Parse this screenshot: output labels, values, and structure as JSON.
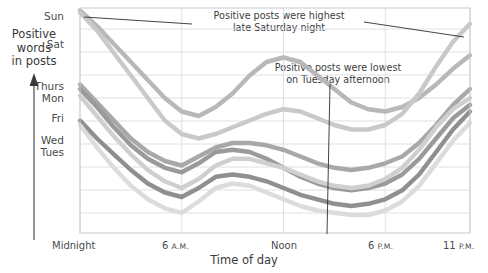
{
  "axis": {
    "y_title_lines": [
      "Positive",
      "words",
      "in posts"
    ],
    "x_title": "Time of day",
    "y_tick_labels": [
      "Sun",
      "Sat",
      "Thurs",
      "Mon",
      "Fri",
      "Wed",
      "Tues"
    ],
    "x_tick_labels": [
      "Midnight",
      "6 A.M.",
      "Noon",
      "6 P.M.",
      "11 P.M."
    ]
  },
  "annotations": [
    {
      "line1": "Positive posts were highest",
      "line2": "late Saturday night"
    },
    {
      "line1": "Positive posts were lowest",
      "line2": "on Tuesday afternoon"
    }
  ],
  "chart_data": {
    "type": "line",
    "title": "",
    "xlabel": "Time of day",
    "ylabel": "Positive words in posts",
    "grid": true,
    "legend": "none",
    "xlim": [
      0,
      23
    ],
    "ylim": [
      0,
      100
    ],
    "x": [
      0,
      1,
      2,
      3,
      4,
      5,
      6,
      7,
      8,
      9,
      10,
      11,
      12,
      13,
      14,
      15,
      16,
      17,
      18,
      19,
      20,
      21,
      22,
      23
    ],
    "x_ticks": [
      0,
      6,
      12,
      18,
      23
    ],
    "x_tick_labels": [
      "Midnight",
      "6 A.M.",
      "Noon",
      "6 P.M.",
      "11 P.M."
    ],
    "y_ticks": [
      96,
      84,
      72,
      60,
      48,
      36,
      24,
      12
    ],
    "y_tick_labels": [
      "Sun",
      "Sat",
      "Thurs",
      "Mon",
      "Fri",
      "Wed",
      "Tues"
    ],
    "series": [
      {
        "name": "Sun",
        "color": "#b8b8b8",
        "values": [
          99,
          92,
          84,
          76,
          68,
          60,
          54,
          52,
          56,
          62,
          70,
          76,
          78,
          76,
          70,
          64,
          58,
          55,
          54,
          56,
          60,
          66,
          73,
          79
        ]
      },
      {
        "name": "Sat",
        "color": "#c9c9c9",
        "values": [
          98,
          90,
          80,
          70,
          60,
          50,
          44,
          42,
          44,
          47,
          50,
          53,
          55,
          54,
          51,
          48,
          46,
          46,
          48,
          53,
          62,
          74,
          85,
          93
        ]
      },
      {
        "name": "Thurs",
        "color": "#a8a8a8",
        "values": [
          66,
          58,
          50,
          42,
          36,
          32,
          30,
          34,
          38,
          40,
          40,
          39,
          37,
          34,
          31,
          29,
          28,
          29,
          31,
          34,
          40,
          48,
          57,
          64
        ]
      },
      {
        "name": "Mon",
        "color": "#9a9a9a",
        "values": [
          64,
          56,
          47,
          39,
          33,
          29,
          27,
          31,
          36,
          37,
          36,
          33,
          29,
          25,
          22,
          20,
          19,
          20,
          22,
          26,
          33,
          42,
          51,
          57
        ]
      },
      {
        "name": "Fri",
        "color": "#cfcfcf",
        "values": [
          61,
          52,
          43,
          35,
          28,
          23,
          20,
          24,
          30,
          33,
          33,
          31,
          29,
          26,
          23,
          21,
          20,
          21,
          24,
          29,
          37,
          47,
          55,
          60
        ]
      },
      {
        "name": "Wed",
        "color": "#8f8f8f",
        "values": [
          50,
          42,
          35,
          28,
          22,
          18,
          16,
          20,
          25,
          26,
          25,
          23,
          20,
          17,
          15,
          13,
          12,
          13,
          15,
          19,
          26,
          36,
          46,
          54
        ]
      },
      {
        "name": "Tues",
        "color": "#dcdcdc",
        "values": [
          48,
          38,
          29,
          21,
          15,
          11,
          9,
          14,
          20,
          22,
          21,
          18,
          15,
          12,
          10,
          9,
          8,
          8,
          10,
          14,
          21,
          31,
          41,
          49
        ]
      }
    ],
    "callouts": [
      {
        "text": "Positive posts were highest late Saturday night",
        "points_to": {
          "x": 23,
          "series": "Sat"
        }
      },
      {
        "text": "Positive posts were lowest on Tuesday afternoon",
        "points_to": {
          "x": 16,
          "series": "Tues"
        }
      }
    ]
  },
  "colors": {
    "grid": "#d8dde2",
    "frame": "#c6ccd2",
    "text": "#3d3d3d",
    "leader": "#2f2f2f"
  }
}
